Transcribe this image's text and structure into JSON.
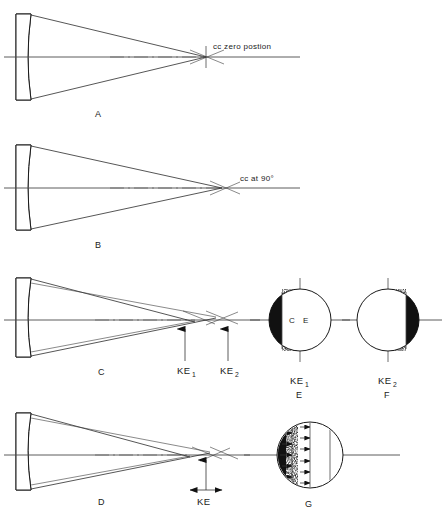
{
  "figure": {
    "background_color": "#ffffff",
    "ink_color": "#1a1a1a"
  },
  "panels": [
    {
      "id": "A",
      "letter": "A",
      "annotation": "cc zero postion",
      "description": "Rays from concave element converge to a single crossing point on the optical axis"
    },
    {
      "id": "B",
      "letter": "B",
      "annotation": "cc at 90°",
      "description": "Rays converge to a crossing point with the beam rotated ninety degrees"
    },
    {
      "id": "C",
      "letter": "C",
      "annotation": "",
      "description": "Two separate focal crossings produce two knife-edge positions",
      "markers": [
        {
          "label": "KE",
          "subscript": "1"
        },
        {
          "label": "KE",
          "subscript": "2"
        }
      ]
    },
    {
      "id": "D",
      "letter": "D",
      "annotation": "",
      "description": "Focal interval measured between two crossings",
      "markers": [
        {
          "label": "KE",
          "subscript": ""
        }
      ]
    }
  ],
  "field_views": [
    {
      "id": "E",
      "letter": "E",
      "marker_label": "KE",
      "marker_subscript": "1",
      "shadow_side": "left",
      "center_labels": [
        "C",
        "E"
      ],
      "description": "Circular field with stippled shadow on the left limb"
    },
    {
      "id": "F",
      "letter": "F",
      "marker_label": "KE",
      "marker_subscript": "2",
      "shadow_side": "right",
      "center_labels": [],
      "description": "Circular field with stippled shadow on the right limb"
    },
    {
      "id": "G",
      "letter": "G",
      "marker_label": "",
      "marker_subscript": "",
      "shadow_side": "left",
      "center_labels": [],
      "description": "Circular field with stippled left limb and vertical lines bearing horizontal arrows"
    }
  ],
  "icons": {
    "arrow_up": "arrow-up-icon",
    "arrow_left": "arrow-left-icon",
    "arrow_right": "arrow-right-icon",
    "crosshair": "crosshair-icon"
  }
}
